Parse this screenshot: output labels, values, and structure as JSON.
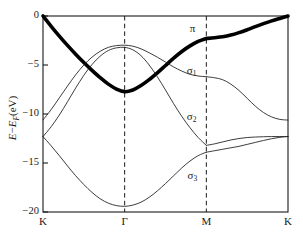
{
  "figure": {
    "type": "band-structure-plot",
    "background_color": "#ffffff",
    "line_color": "#1a1a1a"
  },
  "axes": {
    "y_title_main": "E",
    "y_title_minus": "−",
    "y_title_ef": "E",
    "y_title_ef_sub": "F",
    "y_title_unit": "(eV)",
    "y_title_full": "E−E_F(eV)",
    "y_ticks": [
      "0",
      "−5",
      "−10",
      "−15",
      "−20"
    ],
    "y_tick_values": [
      0,
      -5,
      -10,
      -15,
      -20
    ],
    "ylim": [
      -20,
      0
    ],
    "x_ticks": [
      "K",
      "Γ",
      "M",
      "K"
    ],
    "x_tick_positions": [
      0,
      1,
      2,
      3
    ],
    "xlim": [
      0,
      3
    ],
    "grid": false,
    "vertical_guides": [
      "Γ",
      "M"
    ]
  },
  "band_labels": [
    {
      "text": "π",
      "sub": "",
      "name": "pi-band-label"
    },
    {
      "text": "σ",
      "sub": "1",
      "name": "sigma1-band-label"
    },
    {
      "text": "σ",
      "sub": "2",
      "name": "sigma2-band-label"
    },
    {
      "text": "σ",
      "sub": "3",
      "name": "sigma3-band-label"
    }
  ],
  "chart_data": {
    "type": "line",
    "title": "",
    "xlabel": "",
    "ylabel": "E−E_F(eV)",
    "ylim": [
      -20,
      0
    ],
    "xlim": [
      0,
      3
    ],
    "grid": false,
    "legend": "inline-annotations",
    "x_tick_labels": [
      "K",
      "Γ",
      "M",
      "K"
    ],
    "x_tick_values": [
      0,
      1,
      2,
      3
    ],
    "y_tick_values": [
      0,
      -5,
      -10,
      -15,
      -20
    ],
    "high_symmetry_points": {
      "K_left": 0,
      "Gamma": 1,
      "M": 2,
      "K_right": 3
    },
    "series": [
      {
        "name": "π",
        "style": "thick",
        "linewidth": 3.6,
        "x": [
          0.0,
          0.1,
          0.2,
          0.3,
          0.4,
          0.5,
          0.6,
          0.7,
          0.8,
          0.9,
          1.0,
          1.1,
          1.2,
          1.3,
          1.4,
          1.5,
          1.6,
          1.7,
          1.8,
          1.9,
          2.0,
          2.1,
          2.2,
          2.3,
          2.4,
          2.5,
          2.6,
          2.7,
          2.8,
          2.9,
          3.0
        ],
        "values": [
          0.0,
          -1.05,
          -2.05,
          -3.0,
          -3.9,
          -4.75,
          -5.55,
          -6.3,
          -6.95,
          -7.45,
          -7.72,
          -7.55,
          -7.1,
          -6.5,
          -5.8,
          -5.05,
          -4.3,
          -3.62,
          -3.05,
          -2.6,
          -2.3,
          -2.22,
          -2.12,
          -1.95,
          -1.7,
          -1.4,
          -1.08,
          -0.78,
          -0.5,
          -0.25,
          0.0
        ]
      },
      {
        "name": "σ₁",
        "style": "thin",
        "linewidth": 0.85,
        "x": [
          0.0,
          0.1,
          0.2,
          0.3,
          0.4,
          0.5,
          0.6,
          0.7,
          0.8,
          0.9,
          1.0,
          1.1,
          1.2,
          1.3,
          1.4,
          1.5,
          1.6,
          1.7,
          1.8,
          1.9,
          2.0,
          2.1,
          2.2,
          2.3,
          2.4,
          2.5,
          2.6,
          2.7,
          2.8,
          2.9,
          3.0
        ],
        "values": [
          -10.6,
          -9.55,
          -8.35,
          -7.15,
          -6.0,
          -5.0,
          -4.2,
          -3.6,
          -3.2,
          -3.02,
          -2.98,
          -3.08,
          -3.35,
          -3.75,
          -4.2,
          -4.7,
          -5.2,
          -5.62,
          -5.95,
          -6.12,
          -6.2,
          -6.3,
          -6.5,
          -6.95,
          -7.6,
          -8.4,
          -9.2,
          -9.85,
          -10.3,
          -10.55,
          -10.62
        ]
      },
      {
        "name": "σ₂",
        "style": "thin",
        "linewidth": 0.85,
        "x": [
          0.0,
          0.1,
          0.2,
          0.3,
          0.4,
          0.5,
          0.6,
          0.7,
          0.8,
          0.9,
          1.0,
          1.1,
          1.2,
          1.3,
          1.4,
          1.5,
          1.6,
          1.7,
          1.8,
          1.9,
          2.0,
          2.1,
          2.2,
          2.3,
          2.4,
          2.5,
          2.6,
          2.7,
          2.8,
          2.9,
          3.0
        ],
        "values": [
          -12.3,
          -11.3,
          -10.1,
          -8.75,
          -7.35,
          -6.05,
          -4.95,
          -4.1,
          -3.52,
          -3.25,
          -3.2,
          -3.45,
          -4.05,
          -5.0,
          -6.2,
          -7.55,
          -8.95,
          -10.25,
          -11.4,
          -12.4,
          -13.2,
          -13.05,
          -12.85,
          -12.65,
          -12.5,
          -12.4,
          -12.35,
          -12.32,
          -12.3,
          -12.3,
          -12.3
        ]
      },
      {
        "name": "σ₃",
        "style": "thin",
        "linewidth": 0.85,
        "x": [
          0.0,
          0.1,
          0.2,
          0.3,
          0.4,
          0.5,
          0.6,
          0.7,
          0.8,
          0.9,
          1.0,
          1.1,
          1.2,
          1.3,
          1.4,
          1.5,
          1.6,
          1.7,
          1.8,
          1.9,
          2.0,
          2.1,
          2.2,
          2.3,
          2.4,
          2.5,
          2.6,
          2.7,
          2.8,
          2.9,
          3.0
        ],
        "values": [
          -12.3,
          -13.25,
          -14.25,
          -15.3,
          -16.3,
          -17.2,
          -18.0,
          -18.65,
          -19.1,
          -19.35,
          -19.42,
          -19.3,
          -19.0,
          -18.5,
          -17.85,
          -17.1,
          -16.3,
          -15.5,
          -14.8,
          -14.25,
          -13.9,
          -13.75,
          -13.6,
          -13.45,
          -13.3,
          -13.1,
          -12.9,
          -12.7,
          -12.52,
          -12.38,
          -12.3
        ]
      }
    ],
    "annotations": [
      {
        "label": "π",
        "x": 1.83,
        "y": -1.3
      },
      {
        "label": "σ₁",
        "x": 1.82,
        "y": -5.6
      },
      {
        "label": "σ₂",
        "x": 1.82,
        "y": -10.35
      },
      {
        "label": "σ₃",
        "x": 1.83,
        "y": -16.3
      }
    ]
  }
}
